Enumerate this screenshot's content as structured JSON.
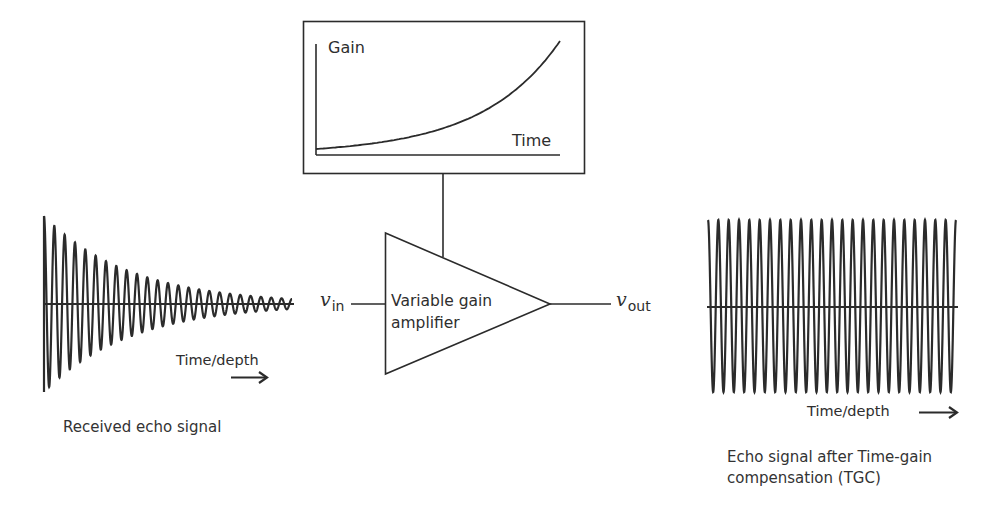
{
  "colors": {
    "stroke": "#2b2b2b",
    "background": "#ffffff"
  },
  "gain_box": {
    "y_label": "Gain",
    "x_label": "Time",
    "curve": "exponential increase"
  },
  "amplifier": {
    "label_line1": "Variable gain",
    "label_line2": "amplifier",
    "input_symbol": "v",
    "input_subscript": "in",
    "output_symbol": "v",
    "output_subscript": "out"
  },
  "received_signal": {
    "axis_label": "Time/depth",
    "arrow": "right-arrow",
    "caption": "Received echo signal",
    "cycles": 24,
    "initial_amplitude": 88,
    "final_amplitude": 5,
    "envelope": "exponential decay"
  },
  "compensated_signal": {
    "axis_label": "Time/depth",
    "arrow": "right-arrow",
    "caption_line1": "Echo signal after Time-gain",
    "caption_line2": "compensation (TGC)",
    "cycles": 24,
    "amplitude": 86,
    "envelope": "constant"
  }
}
